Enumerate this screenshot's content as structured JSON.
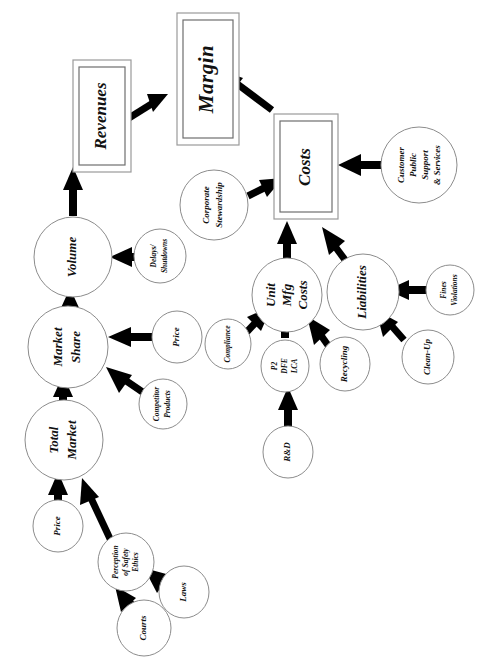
{
  "diagram": {
    "orientation": "rotated-90-counterclockwise",
    "page_background": "#ffffff",
    "ink_color": "#000000",
    "node_stroke_color": "#8c8c8c",
    "nodes": [
      {
        "id": "margin",
        "label": "Margin",
        "shape": "double-box",
        "size": "xl"
      },
      {
        "id": "revenues",
        "label": "Revenues",
        "shape": "double-box",
        "size": "lg"
      },
      {
        "id": "costs",
        "label": "Costs",
        "shape": "double-box",
        "size": "lg"
      },
      {
        "id": "volume",
        "label": "Volume",
        "shape": "ellipse",
        "size": "md"
      },
      {
        "id": "market_share",
        "label": "Market\nShare",
        "shape": "ellipse",
        "size": "md"
      },
      {
        "id": "total_market",
        "label": "Total\nMarket",
        "shape": "ellipse",
        "size": "md"
      },
      {
        "id": "unit_mfg",
        "label": "Unit\nMfg\nCosts",
        "shape": "ellipse",
        "size": "md"
      },
      {
        "id": "liabilities",
        "label": "Liabilities",
        "shape": "ellipse",
        "size": "md"
      },
      {
        "id": "cust_support",
        "label": "Customer\nPublic\nSupport\n& Services",
        "shape": "ellipse",
        "size": "sm"
      },
      {
        "id": "corp_steward",
        "label": "Corporate\nStewardship",
        "shape": "ellipse",
        "size": "sm"
      },
      {
        "id": "delays",
        "label": "Delays/\nShutdowns",
        "shape": "ellipse",
        "size": "xs"
      },
      {
        "id": "price_share",
        "label": "Price",
        "shape": "ellipse",
        "size": "sm"
      },
      {
        "id": "competitor",
        "label": "Competitor\nProducts",
        "shape": "ellipse",
        "size": "xs"
      },
      {
        "id": "compliance",
        "label": "Compliance",
        "shape": "ellipse",
        "size": "xs"
      },
      {
        "id": "p2_dfe_lca",
        "label": "P2\nDFE\nLCA",
        "shape": "ellipse",
        "size": "xs"
      },
      {
        "id": "recycling",
        "label": "Recycling",
        "shape": "ellipse",
        "size": "sm"
      },
      {
        "id": "rnd",
        "label": "R&D",
        "shape": "ellipse",
        "size": "sm"
      },
      {
        "id": "fines",
        "label": "Fines\nViolations",
        "shape": "ellipse",
        "size": "xs"
      },
      {
        "id": "cleanup",
        "label": "Clean-Up",
        "shape": "ellipse",
        "size": "sm"
      },
      {
        "id": "price_market",
        "label": "Price",
        "shape": "ellipse",
        "size": "sm"
      },
      {
        "id": "perception",
        "label": "Perception\nof Safety\nEthics",
        "shape": "ellipse",
        "size": "xs"
      },
      {
        "id": "laws",
        "label": "Laws",
        "shape": "ellipse",
        "size": "sm"
      },
      {
        "id": "courts",
        "label": "Courts",
        "shape": "ellipse",
        "size": "sm"
      }
    ],
    "edges": [
      {
        "from": "revenues",
        "to": "margin"
      },
      {
        "from": "costs",
        "to": "margin"
      },
      {
        "from": "volume",
        "to": "revenues"
      },
      {
        "from": "delays",
        "to": "volume"
      },
      {
        "from": "market_share",
        "to": "volume"
      },
      {
        "from": "price_share",
        "to": "market_share"
      },
      {
        "from": "competitor",
        "to": "market_share"
      },
      {
        "from": "total_market",
        "to": "market_share"
      },
      {
        "from": "price_market",
        "to": "total_market"
      },
      {
        "from": "perception",
        "to": "total_market"
      },
      {
        "from": "laws",
        "to": "perception"
      },
      {
        "from": "courts",
        "to": "perception"
      },
      {
        "from": "unit_mfg",
        "to": "costs"
      },
      {
        "from": "liabilities",
        "to": "costs"
      },
      {
        "from": "cust_support",
        "to": "costs"
      },
      {
        "from": "corp_steward",
        "to": "costs"
      },
      {
        "from": "compliance",
        "to": "unit_mfg"
      },
      {
        "from": "p2_dfe_lca",
        "to": "unit_mfg"
      },
      {
        "from": "recycling",
        "to": "unit_mfg"
      },
      {
        "from": "rnd",
        "to": "p2_dfe_lca"
      },
      {
        "from": "fines",
        "to": "liabilities"
      },
      {
        "from": "cleanup",
        "to": "liabilities"
      }
    ]
  }
}
